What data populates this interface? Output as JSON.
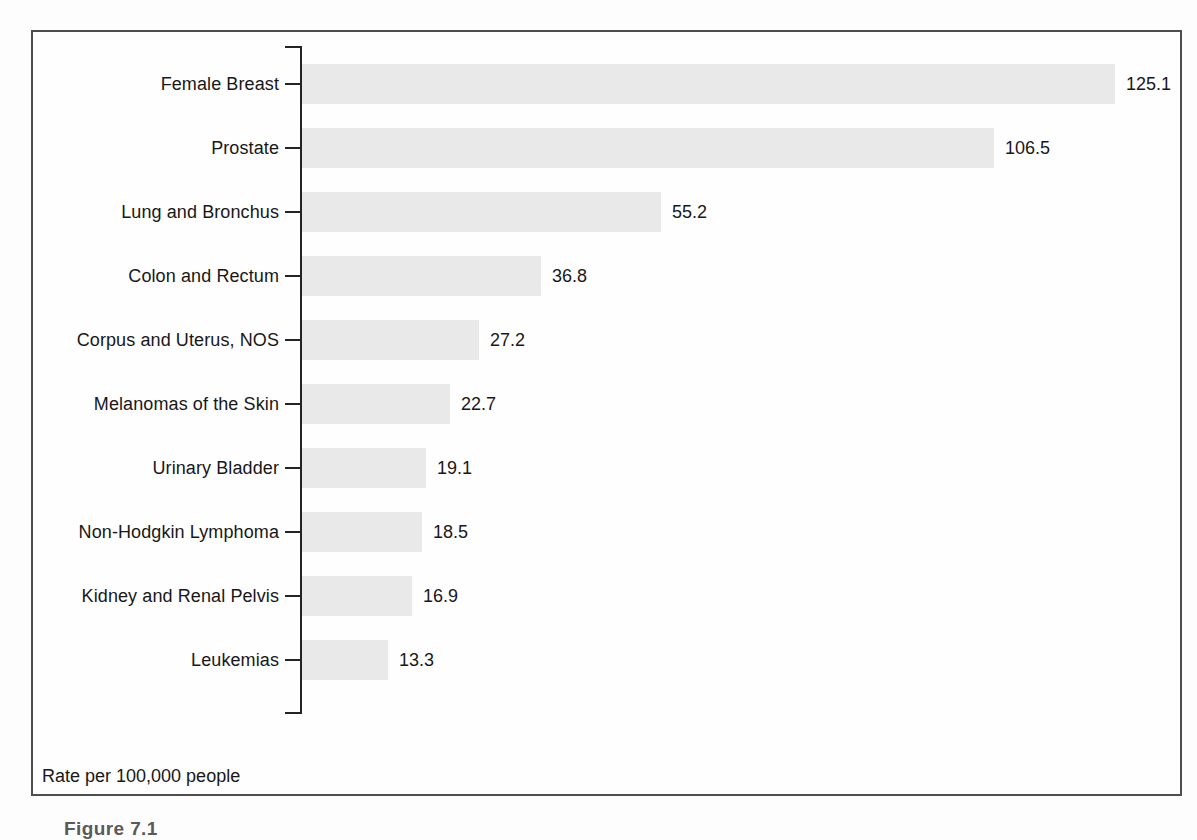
{
  "chart_data": {
    "type": "bar",
    "orientation": "horizontal",
    "title": "",
    "categories": [
      "Female Breast",
      "Prostate",
      "Lung and Bronchus",
      "Colon and Rectum",
      "Corpus and Uterus, NOS",
      "Melanomas of the Skin",
      "Urinary Bladder",
      "Non-Hodgkin Lymphoma",
      "Kidney and Renal Pelvis",
      "Leukemias"
    ],
    "values": [
      125.1,
      106.5,
      55.2,
      36.8,
      27.2,
      22.7,
      19.1,
      18.5,
      16.9,
      13.3
    ],
    "value_labels": [
      "125.1",
      "106.5",
      "55.2",
      "36.8",
      "27.2",
      "22.7",
      "19.1",
      "18.5",
      "16.9",
      "13.3"
    ],
    "unit_note": "Rate per 100,000 people",
    "xlim": [
      0,
      130
    ],
    "grid": false,
    "legend": false
  },
  "caption_fragment": "Figure 7.1",
  "colors": {
    "bar": "#e9e9e9",
    "axis": "#242424",
    "text": "#181818",
    "frame_border": "#4e4e4e",
    "background": "#fdfdfd"
  }
}
